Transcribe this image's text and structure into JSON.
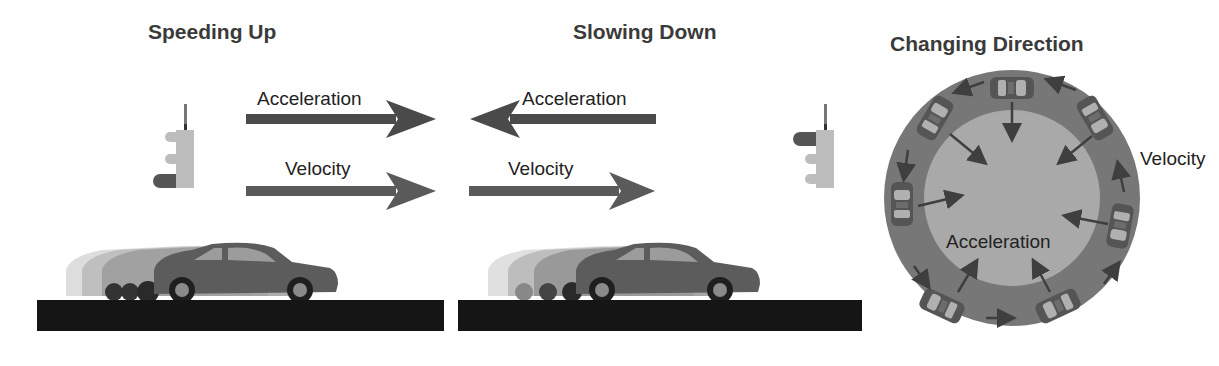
{
  "panels": [
    {
      "title": "Speeding Up",
      "acceleration_label": "Acceleration",
      "velocity_label": "Velocity",
      "acceleration_direction": "right",
      "velocity_direction": "right",
      "traffic_light_lit": "green"
    },
    {
      "title": "Slowing Down",
      "acceleration_label": "Acceleration",
      "velocity_label": "Velocity",
      "acceleration_direction": "left",
      "velocity_direction": "right",
      "traffic_light_lit": "red"
    },
    {
      "title": "Changing Direction",
      "acceleration_label": "Acceleration",
      "velocity_label": "Velocity",
      "acceleration_direction": "toward-center",
      "velocity_direction": "counter-clockwise-tangent"
    }
  ],
  "colors": {
    "arrow": "#4a4a4a",
    "car": "#5c5c5c",
    "road": "#151515",
    "track_outer": "#777777",
    "track_inner": "#a9a9a9",
    "light_housing": "#bdbdbd",
    "light_lit": "#555555"
  }
}
